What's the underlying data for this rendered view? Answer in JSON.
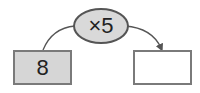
{
  "diagram": {
    "operator": {
      "label": "×5",
      "fill": "#d9d9d9",
      "border": "#555555"
    },
    "input_box": {
      "value": "8",
      "fill": "#d6d6d6",
      "border": "#7a7a7a"
    },
    "output_box": {
      "value": "",
      "fill": "#ffffff",
      "border": "#7a7a7a"
    },
    "connector_color": "#555555"
  }
}
